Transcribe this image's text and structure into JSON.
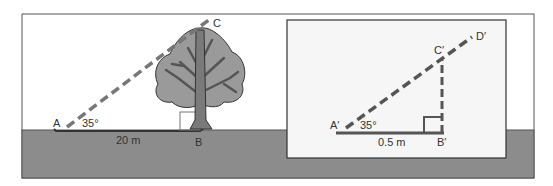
{
  "scene": {
    "labels": {
      "A": "A",
      "B": "B",
      "C": "C",
      "angle": "35°",
      "distance": "20 m"
    }
  },
  "model": {
    "labels": {
      "A": "A′",
      "B": "B′",
      "C": "C′",
      "D": "D′",
      "angle": "35°",
      "distance": "0.5 m"
    }
  },
  "colors": {
    "ground": "#8c8c8c",
    "line": "#555555",
    "dash": "#777777",
    "tree_fill": "#9a9a9a",
    "trunk": "#7a7a7a",
    "panel": "#f6f6f6"
  }
}
